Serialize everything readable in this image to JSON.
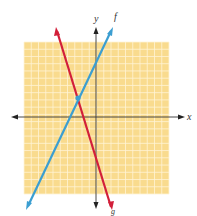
{
  "chart_data": {
    "type": "line",
    "title": "",
    "xlabel": "x",
    "ylabel": "y",
    "xlim": [
      -10,
      10
    ],
    "ylim": [
      -10,
      10
    ],
    "grid": true,
    "series": [
      {
        "name": "f",
        "color": "#3b9ed1",
        "slope": 2,
        "intercept": 8,
        "x": [
          -8.5,
          4.3
        ],
        "y": [
          -9,
          16.6
        ]
      },
      {
        "name": "g",
        "color": "#d21f3a",
        "slope": -3,
        "intercept": -6,
        "x": [
          -3.6,
          0.9
        ],
        "y": [
          4.8,
          -8.7
        ]
      }
    ],
    "annotations": [
      {
        "type": "point",
        "x": -2.8,
        "y": 2.4,
        "label": "intersection"
      }
    ],
    "colors": {
      "background_grid": "#f9db8e",
      "gridline": "#fff6dc",
      "axis": "#333333"
    }
  },
  "labels": {
    "x_axis": "x",
    "y_axis": "y",
    "f": "f",
    "g": "g"
  }
}
